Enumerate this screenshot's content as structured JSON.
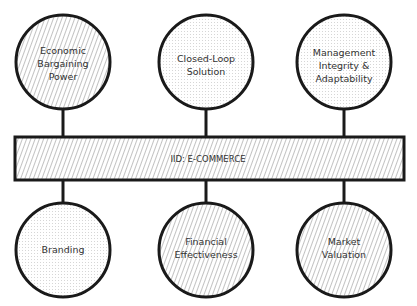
{
  "diagram": {
    "center_bar": {
      "label": "IID: E-COMMERCE",
      "fill": "hatched"
    },
    "top_nodes": [
      {
        "lines": [
          "Economic",
          "Bargaining",
          "Power"
        ],
        "fill": "hatched"
      },
      {
        "lines": [
          "Closed-Loop",
          "Solution"
        ],
        "fill": "dotted"
      },
      {
        "lines": [
          "Management",
          "Integrity &",
          "Adaptability"
        ],
        "fill": "dotted"
      }
    ],
    "bottom_nodes": [
      {
        "lines": [
          "Branding"
        ],
        "fill": "dotted"
      },
      {
        "lines": [
          "Financial",
          "Effectiveness"
        ],
        "fill": "hatched"
      },
      {
        "lines": [
          "Market",
          "Valuation"
        ],
        "fill": "hatched"
      }
    ],
    "colors": {
      "stroke": "#1a1a1a",
      "hatch": "#555555",
      "dot": "#bbbbbb",
      "text": "#333333"
    }
  }
}
